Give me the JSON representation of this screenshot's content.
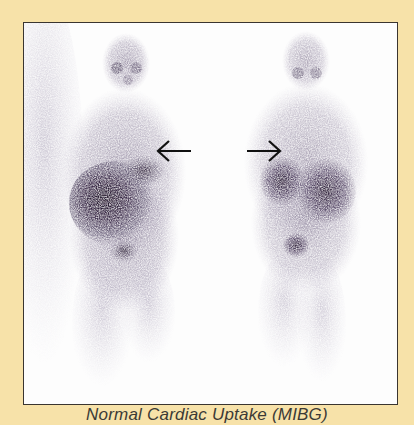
{
  "figure": {
    "background_color": "#f7e2a9",
    "frame_border_color": "#3a3530",
    "image_background": "#fdfdfd",
    "tracer_color": "#4a3a5c",
    "caption": "Normal Cardiac Uptake (MIBG)",
    "panels": [
      {
        "view": "anterior",
        "arrow_direction": "left",
        "arrow_label": "left-arrow"
      },
      {
        "view": "posterior",
        "arrow_direction": "right",
        "arrow_label": "right-arrow"
      }
    ]
  }
}
